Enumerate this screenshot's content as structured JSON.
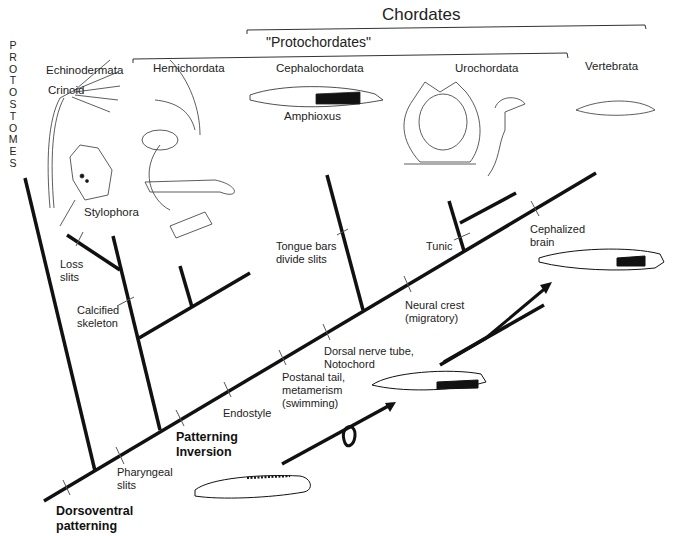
{
  "title": "Chordates",
  "subtitle": "\"Protochordates\"",
  "outgroup_label": "P\nR\nO\nT\nO\nS\nT\nO\nM\nE\nS",
  "taxa": {
    "echinodermata": "Echinodermata",
    "crinoid": "Crinoid",
    "stylophora": "Stylophora",
    "hemichordata": "Hemichordata",
    "cephalochordata": "Cephalochordata",
    "amphioxus": "Amphioxus",
    "urochordata": "Urochordata",
    "vertebrata": "Vertebrata"
  },
  "characters": {
    "dorsoventral": "Dorsoventral\npatterning",
    "pharyngeal": "Pharyngeal\nslits",
    "patterning_inversion": "Patterning\nInversion",
    "endostyle": "Endostyle",
    "postanal": "Postanal tail,\nmetamerism\n(swimming)",
    "dorsal_nerve": "Dorsal nerve tube,\nNotochord",
    "neural_crest": "Neural crest\n(migratory)",
    "tongue_bars": "Tongue bars\ndivide slits",
    "tunic": "Tunic",
    "cephalized_brain": "Cephalized\nbrain",
    "loss_slits": "Loss\nslits",
    "calcified_skeleton": "Calcified\nskeleton"
  },
  "colors": {
    "line": "#111111",
    "tick": "#555555",
    "bracket": "#333333"
  }
}
